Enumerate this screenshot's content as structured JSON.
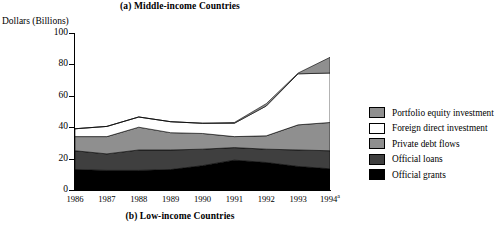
{
  "figure": {
    "panel_a_title": "(a) Middle-income Countries",
    "panel_b_title": "(b) Low-income Countries",
    "y_axis_label": "Dollars (Billions)"
  },
  "chart_data": {
    "type": "area",
    "title": "(a) Middle-income Countries",
    "xlabel": "",
    "ylabel": "Dollars (Billions)",
    "categories": [
      "1986",
      "1987",
      "1988",
      "1989",
      "1990",
      "1991",
      "1992",
      "1993",
      "1994a"
    ],
    "x_tick_labels": [
      "1986",
      "1987",
      "1988",
      "1989",
      "1990",
      "1991",
      "1992",
      "1993",
      "1994"
    ],
    "x_tick_superscripts": [
      "",
      "",
      "",
      "",
      "",
      "",
      "",
      "",
      "a"
    ],
    "ylim": [
      0,
      100
    ],
    "y_ticks": [
      0,
      20,
      40,
      60,
      80,
      100
    ],
    "grid": false,
    "legend_position": "right",
    "stacked": true,
    "stack_order_bottom_to_top": [
      "Official grants",
      "Official loans",
      "Private debt flows",
      "Foreign direct investment",
      "Portfolio equity investment"
    ],
    "series": [
      {
        "name": "Official grants",
        "color": "#000000",
        "values": [
          13.0,
          12.5,
          12.5,
          13.0,
          15.5,
          19.0,
          17.5,
          15.0,
          13.5
        ]
      },
      {
        "name": "Official loans",
        "color": "#3f3f3f",
        "values": [
          12.0,
          10.5,
          13.0,
          12.5,
          10.5,
          8.0,
          8.5,
          10.5,
          11.5
        ]
      },
      {
        "name": "Private debt flows",
        "color": "#8f8f8f",
        "values": [
          9.0,
          11.0,
          14.5,
          11.0,
          10.0,
          7.0,
          8.5,
          16.0,
          18.0
        ]
      },
      {
        "name": "Foreign direct investment",
        "color": "#ffffff",
        "values": [
          5.0,
          6.5,
          6.5,
          7.0,
          6.5,
          8.5,
          19.0,
          32.5,
          31.5
        ]
      },
      {
        "name": "Portfolio equity investment",
        "color": "#8f8f8f",
        "values": [
          0.0,
          0.0,
          0.0,
          0.0,
          0.0,
          0.5,
          1.5,
          0.5,
          10.0
        ]
      }
    ],
    "stack_tops": {
      "Official grants": [
        13.0,
        12.5,
        12.5,
        13.0,
        15.5,
        19.0,
        17.5,
        15.0,
        13.5
      ],
      "Official loans": [
        25.0,
        23.0,
        25.5,
        25.5,
        26.0,
        27.0,
        26.0,
        25.5,
        25.0
      ],
      "Private debt flows": [
        34.0,
        34.0,
        40.0,
        36.5,
        36.0,
        34.0,
        34.5,
        41.5,
        43.0
      ],
      "Foreign direct investment": [
        39.0,
        40.5,
        46.5,
        43.5,
        42.5,
        42.5,
        53.5,
        74.0,
        74.5
      ],
      "Portfolio equity investment": [
        39.0,
        40.5,
        46.5,
        43.5,
        42.5,
        43.0,
        55.0,
        74.5,
        84.5
      ]
    }
  },
  "legend": {
    "items": [
      {
        "label": "Portfolio equity investment",
        "color": "#8f8f8f"
      },
      {
        "label": "Foreign direct investment",
        "color": "#ffffff"
      },
      {
        "label": "Private debt flows",
        "color": "#8f8f8f"
      },
      {
        "label": "Official loans",
        "color": "#3f3f3f"
      },
      {
        "label": "Official grants",
        "color": "#000000"
      }
    ]
  }
}
